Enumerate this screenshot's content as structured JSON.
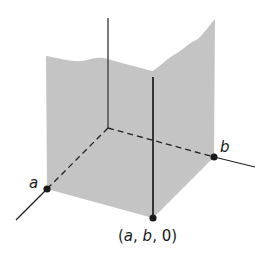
{
  "diagram": {
    "type": "3d-coordinate-region",
    "colors": {
      "region_fill": "#c4c4c4",
      "axis": "#333333",
      "point": "#1a1a1a",
      "background": "#ffffff"
    },
    "labels": {
      "a": "a",
      "b": "b",
      "point_open": "(",
      "point_a": "a",
      "point_sep1": ", ",
      "point_b": "b",
      "point_sep2": ", ",
      "point_zero": "0",
      "point_close": ")"
    },
    "points": [
      {
        "name": "a",
        "on_axis": "x"
      },
      {
        "name": "b",
        "on_axis": "y"
      },
      {
        "name": "(a, b, 0)",
        "on_axis": "xy-plane"
      }
    ]
  }
}
